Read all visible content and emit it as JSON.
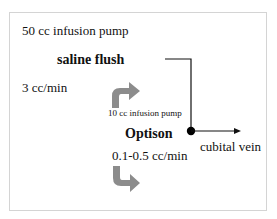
{
  "diagram": {
    "saline_pump_label": "50 cc infusion pump",
    "saline_label": "saline flush",
    "saline_rate": "3 cc/min",
    "optison_pump_label": "10 cc infusion pump",
    "optison_label": "Optison",
    "optison_rate": "0.1-0.5 cc/min",
    "outlet_label": "cubital vein",
    "colors": {
      "line": "#111111",
      "arrow_fill": "#8c8c8c",
      "frame": "#d4d4d4"
    }
  }
}
